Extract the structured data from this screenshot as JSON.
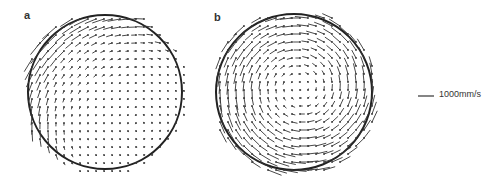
{
  "chart_data": {
    "type": "vector_field",
    "title": "",
    "panels": [
      {
        "label": "a",
        "center": [
          105,
          92
        ],
        "radius": 77,
        "flow": "strong clockwise-sweeping jet along upper-left wall (leftward along top, downward along left), near-stagnant lower-right region",
        "vortex_center": [
          140,
          125
        ],
        "peak_vector_px": 14
      },
      {
        "label": "b",
        "center": [
          294,
          92
        ],
        "radius": 78,
        "flow": "single counterclockwise vortex filling the circle, strongest near wall",
        "vortex_center": [
          300,
          88
        ],
        "peak_vector_px": 13
      }
    ],
    "scale": {
      "label": "1000mm/s",
      "length_px": 16
    },
    "grid_spacing_px": 8
  },
  "labels": {
    "a": "a",
    "b": "b",
    "scale": "1000mm/s"
  }
}
